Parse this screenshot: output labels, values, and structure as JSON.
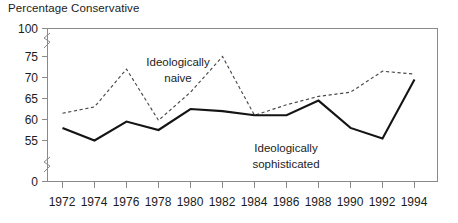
{
  "chart_data": {
    "type": "line",
    "title": "Percentage Conservative",
    "xlabel": "",
    "ylabel": "",
    "x": [
      1972,
      1974,
      1976,
      1978,
      1980,
      1982,
      1984,
      1986,
      1988,
      1990,
      1992,
      1994
    ],
    "xticklabels": [
      "1972",
      "1974",
      "1976",
      "1978",
      "1980",
      "1982",
      "1984",
      "1986",
      "1988",
      "1990",
      "1992",
      "1994"
    ],
    "yticklabels": [
      "0",
      "55",
      "60",
      "65",
      "70",
      "75",
      "100"
    ],
    "ytickvalues": [
      0,
      55,
      60,
      65,
      70,
      75,
      100
    ],
    "ylim": [
      0,
      100
    ],
    "xlim": [
      1972,
      1994
    ],
    "axis_break": true,
    "grid": false,
    "legend_position": "inline-annotations",
    "series": [
      {
        "name": "Ideologically naive",
        "style": "dashed",
        "color": "#4a4a4a",
        "label_position": "inline",
        "values": [
          61.5,
          63.0,
          72.0,
          59.8,
          66.5,
          75.0,
          61.0,
          63.5,
          65.5,
          66.5,
          71.5,
          70.8
        ]
      },
      {
        "name": "Ideologically sophisticated",
        "style": "solid",
        "color": "#141414",
        "label_position": "inline",
        "values": [
          58.0,
          55.0,
          59.5,
          57.5,
          62.5,
          62.0,
          61.0,
          61.0,
          64.5,
          58.0,
          55.5,
          69.5
        ]
      }
    ],
    "annotations": [
      {
        "name": "naive-label",
        "text_line1": "Ideologically",
        "text_line2": "naive"
      },
      {
        "name": "sophisticated-label",
        "text_line1": "Ideologically",
        "text_line2": "sophisticated"
      }
    ]
  }
}
